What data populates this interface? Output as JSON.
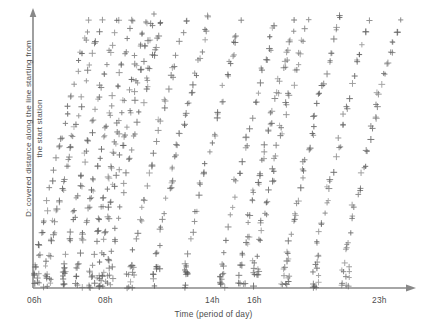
{
  "figure": {
    "background_color": "#ffffff",
    "marker_color": "#5a5a5a",
    "axis_color": "#888888",
    "text_color": "#4d4d4d"
  },
  "axes": {
    "y_label_line1": "D: covered distance along the line starting from",
    "y_label_line2": "the start station",
    "x_label": "Time (period of day)",
    "x_tick_labels": [
      {
        "text": "06h",
        "x": 27
      },
      {
        "text": "08h",
        "x": 98
      },
      {
        "text": "14h",
        "x": 205
      },
      {
        "text": "16h",
        "x": 247
      },
      {
        "text": "23h",
        "x": 372
      }
    ]
  },
  "chart_data": {
    "type": "scatter",
    "title": "",
    "xlabel": "Time (period of day)",
    "ylabel": "D: covered distance along the line starting from the start station",
    "grid": false,
    "legend": null,
    "marker": "+",
    "marker_color": "#5a5a5a",
    "xlim": [
      6,
      23
    ],
    "ylim": [
      0,
      1
    ],
    "xtick_values": [
      6,
      8,
      14,
      16,
      23
    ],
    "xtick_labels": [
      "06h",
      "08h",
      "14h",
      "16h",
      "23h"
    ],
    "runs": [
      {
        "start_time": 6.05,
        "duration": 2.55,
        "n_points": 26,
        "y_start": 0.01,
        "y_end": 0.98
      },
      {
        "start_time": 6.55,
        "duration": 2.55,
        "n_points": 26,
        "y_start": 0.01,
        "y_end": 0.98
      },
      {
        "start_time": 7.35,
        "duration": 2.5,
        "n_points": 25,
        "y_start": 0.01,
        "y_end": 0.97
      },
      {
        "start_time": 7.95,
        "duration": 2.55,
        "n_points": 26,
        "y_start": 0.01,
        "y_end": 0.98
      },
      {
        "start_time": 8.55,
        "duration": 2.5,
        "n_points": 25,
        "y_start": 0.01,
        "y_end": 0.97
      },
      {
        "start_time": 8.95,
        "duration": 2.55,
        "n_points": 26,
        "y_start": 0.01,
        "y_end": 0.99
      },
      {
        "start_time": 9.35,
        "duration": 2.5,
        "n_points": 24,
        "y_start": 0.01,
        "y_end": 0.97
      },
      {
        "start_time": 10.35,
        "duration": 2.55,
        "n_points": 25,
        "y_start": 0.01,
        "y_end": 0.97
      },
      {
        "start_time": 11.45,
        "duration": 2.55,
        "n_points": 26,
        "y_start": 0.01,
        "y_end": 0.98
      },
      {
        "start_time": 12.85,
        "duration": 2.55,
        "n_points": 25,
        "y_start": 0.01,
        "y_end": 0.97
      },
      {
        "start_time": 14.45,
        "duration": 2.5,
        "n_points": 24,
        "y_start": 0.01,
        "y_end": 0.96
      },
      {
        "start_time": 15.35,
        "duration": 2.55,
        "n_points": 27,
        "y_start": 0.01,
        "y_end": 0.98
      },
      {
        "start_time": 15.95,
        "duration": 2.55,
        "n_points": 26,
        "y_start": 0.01,
        "y_end": 0.98
      },
      {
        "start_time": 17.35,
        "duration": 2.55,
        "n_points": 26,
        "y_start": 0.01,
        "y_end": 0.98
      },
      {
        "start_time": 18.65,
        "duration": 2.55,
        "n_points": 26,
        "y_start": 0.01,
        "y_end": 0.97
      },
      {
        "start_time": 20.05,
        "duration": 2.55,
        "n_points": 25,
        "y_start": 0.01,
        "y_end": 0.98
      }
    ]
  },
  "geometry": {
    "origin_x": 33,
    "baseline_y": 288,
    "plot_top_y": 14,
    "plot_right_x": 408,
    "x_axis_arrow_tip": 416,
    "y_axis_arrow_tip": 8
  }
}
